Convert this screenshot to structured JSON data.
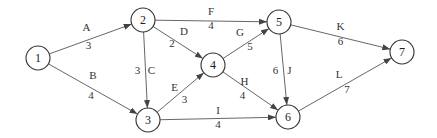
{
  "diagram": {
    "type": "network",
    "nodes": [
      {
        "id": "1",
        "label": "1",
        "x": 38,
        "y": 58
      },
      {
        "id": "2",
        "label": "2",
        "x": 143,
        "y": 20
      },
      {
        "id": "3",
        "label": "3",
        "x": 148,
        "y": 120
      },
      {
        "id": "4",
        "label": "4",
        "x": 213,
        "y": 65
      },
      {
        "id": "5",
        "label": "5",
        "x": 279,
        "y": 22
      },
      {
        "id": "6",
        "label": "6",
        "x": 288,
        "y": 117
      },
      {
        "id": "7",
        "label": "7",
        "x": 402,
        "y": 52
      }
    ],
    "edges": [
      {
        "from": "1",
        "to": "2",
        "name": "A",
        "weight": "3"
      },
      {
        "from": "1",
        "to": "3",
        "name": "B",
        "weight": "4"
      },
      {
        "from": "2",
        "to": "3",
        "name": "C",
        "weight": "3"
      },
      {
        "from": "2",
        "to": "4",
        "name": "D",
        "weight": "2"
      },
      {
        "from": "3",
        "to": "4",
        "name": "E",
        "weight": "3"
      },
      {
        "from": "2",
        "to": "5",
        "name": "F",
        "weight": "4"
      },
      {
        "from": "4",
        "to": "5",
        "name": "G",
        "weight": "5"
      },
      {
        "from": "4",
        "to": "6",
        "name": "H",
        "weight": "4"
      },
      {
        "from": "3",
        "to": "6",
        "name": "I",
        "weight": "4"
      },
      {
        "from": "5",
        "to": "6",
        "name": "J",
        "weight": "6"
      },
      {
        "from": "5",
        "to": "7",
        "name": "K",
        "weight": "6"
      },
      {
        "from": "6",
        "to": "7",
        "name": "L",
        "weight": "7"
      }
    ]
  }
}
